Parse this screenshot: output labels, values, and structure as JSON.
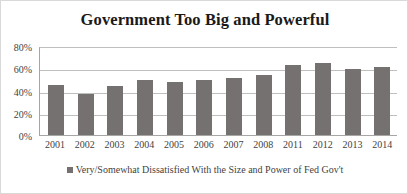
{
  "chart_data": {
    "type": "bar",
    "title": "Government Too Big and Powerful",
    "xlabel": "",
    "ylabel": "",
    "ylim": [
      0,
      80
    ],
    "ytick_labels": [
      "80%",
      "60%",
      "40%",
      "20%",
      "0%"
    ],
    "ytick_values": [
      80,
      60,
      40,
      20,
      0
    ],
    "grid": true,
    "legend_position": "bottom",
    "series_color": "#767171",
    "categories": [
      "2001",
      "2002",
      "2003",
      "2004",
      "2005",
      "2006",
      "2007",
      "2008",
      "2011",
      "2012",
      "2013",
      "2014"
    ],
    "series": [
      {
        "name": "Very/Somewhat Dissatisfied With the Size and Power of Fed Gov't",
        "values": [
          46,
          38,
          45,
          50,
          49,
          50,
          52,
          55,
          64,
          66,
          60,
          62
        ]
      }
    ],
    "legend": [
      {
        "label": "Very/Somewhat Dissatisfied With the Size and Power of Fed Gov't",
        "color": "#767171",
        "marker": "square-swatch"
      }
    ]
  },
  "card": {
    "border_color": "#d9d9d9",
    "background": "#ffffff"
  }
}
